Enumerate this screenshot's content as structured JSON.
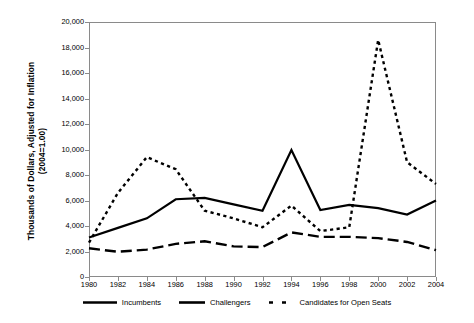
{
  "chart_data": {
    "type": "line",
    "title": "",
    "xlabel": "",
    "ylabel": "Thousands of Dollars, Adjusted for Inflation (2004=1.00)",
    "ylabel_line1": "Thousands of Dollars, Adjusted for Inflation",
    "ylabel_line2": "(2004=1.00)",
    "x": [
      1980,
      1982,
      1984,
      1986,
      1988,
      1990,
      1992,
      1994,
      1996,
      1998,
      2000,
      2002,
      2004
    ],
    "categories": [
      "1980",
      "1982",
      "1984",
      "1986",
      "1988",
      "1990",
      "1992",
      "1994",
      "1996",
      "1998",
      "2000",
      "2002",
      "2004"
    ],
    "ylim": [
      0,
      20000
    ],
    "xlim": [
      1980,
      2004
    ],
    "yticks": [
      0,
      2000,
      4000,
      6000,
      8000,
      10000,
      12000,
      14000,
      16000,
      18000,
      20000
    ],
    "ytick_labels": [
      "0",
      "2,000",
      "4,000",
      "6,000",
      "8,000",
      "10,000",
      "12,000",
      "14,000",
      "16,000",
      "18,000",
      "20,000"
    ],
    "grid": false,
    "legend_position": "bottom",
    "series": [
      {
        "name": "Incumbents",
        "style": "solid",
        "color": "#000000",
        "values": [
          3100,
          3850,
          4600,
          6100,
          6200,
          5700,
          5200,
          9950,
          5250,
          5650,
          5400,
          4900,
          6000
        ]
      },
      {
        "name": "Challengers",
        "style": "dashed",
        "color": "#000000",
        "values": [
          2250,
          1980,
          2150,
          2600,
          2800,
          2400,
          2350,
          3500,
          3150,
          3150,
          3050,
          2750,
          2100
        ]
      },
      {
        "name": "Candidates for Open Seats",
        "style": "dotted",
        "color": "#000000",
        "values": [
          2700,
          6600,
          9400,
          8450,
          5200,
          4600,
          3900,
          5600,
          3600,
          3900,
          18600,
          9000,
          7300
        ]
      }
    ]
  },
  "legend": {
    "items": [
      {
        "label": "Incumbents",
        "key": "solid-line-key"
      },
      {
        "label": "Challengers",
        "key": "dashed-line-key"
      },
      {
        "label": "Candidates for Open Seats",
        "key": "dotted-line-key"
      }
    ]
  }
}
